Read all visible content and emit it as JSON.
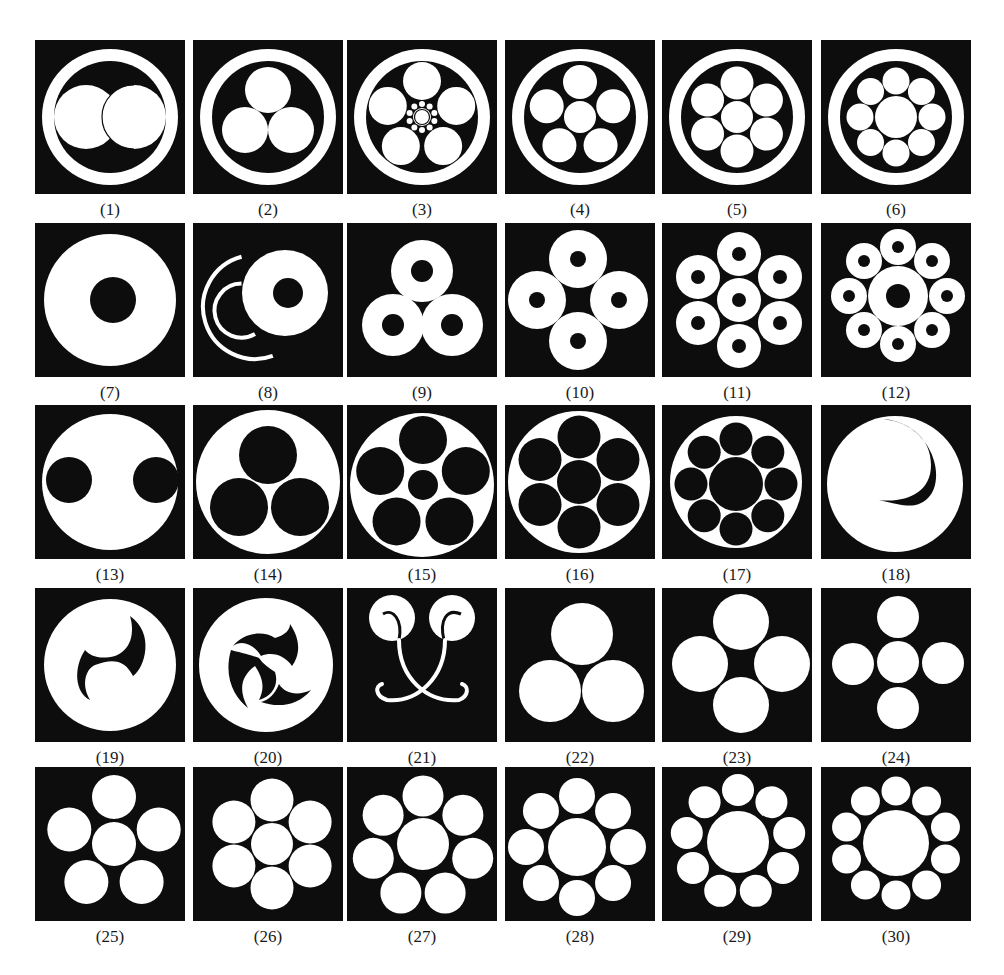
{
  "figure": {
    "title": "",
    "colors": {
      "background": "#ffffff",
      "tile": "#0d0d0d",
      "shape": "#ffffff",
      "label": "#1a1a1a"
    },
    "grid": {
      "columns_x": [
        35,
        193,
        347,
        505,
        662,
        821
      ],
      "rows_y": [
        40,
        223,
        405,
        588,
        767
      ],
      "tile_width": 150,
      "tile_height": 154,
      "label_offset": 160
    },
    "emblems": [
      {
        "id": 1,
        "label": "(1)",
        "name": "two-overlapping-circles-in-ring",
        "shapes": [
          [
            "ring",
            75,
            77,
            68,
            12
          ],
          [
            "c",
            51,
            77,
            32,
            "w"
          ],
          [
            "c",
            99,
            77,
            32,
            "w"
          ],
          [
            "arc",
            99,
            77,
            32,
            "k",
            1.2
          ]
        ]
      },
      {
        "id": 2,
        "label": "(2)",
        "name": "three-circles-in-ring",
        "shapes": [
          [
            "ring",
            75,
            77,
            68,
            12
          ],
          [
            "c",
            75,
            50,
            23,
            "w"
          ],
          [
            "c",
            52,
            90,
            23,
            "w"
          ],
          [
            "c",
            98,
            90,
            23,
            "w"
          ]
        ]
      },
      {
        "id": 3,
        "label": "(3)",
        "name": "five-circles-with-small-center-ring",
        "shapes": [
          [
            "ring",
            75,
            77,
            68,
            12
          ],
          [
            "poly5",
            75,
            77,
            36,
            19,
            "w"
          ],
          [
            "c",
            75,
            77,
            9,
            "w"
          ],
          [
            "c",
            75,
            77,
            7.5,
            "k-outline"
          ],
          [
            "dots",
            75,
            77,
            13,
            10,
            3,
            "w"
          ]
        ]
      },
      {
        "id": 4,
        "label": "(4)",
        "name": "six-circles-five-around-one-in-ring",
        "shapes": [
          [
            "ring",
            75,
            77,
            68,
            12
          ],
          [
            "c",
            75,
            77,
            16,
            "w"
          ],
          [
            "poly5",
            75,
            77,
            35,
            17,
            "w"
          ]
        ]
      },
      {
        "id": 5,
        "label": "(5)",
        "name": "seven-circles-in-ring",
        "shapes": [
          [
            "ring",
            75,
            77,
            68,
            12
          ],
          [
            "c",
            75,
            77,
            16,
            "w"
          ],
          [
            "poly6",
            75,
            77,
            34,
            16.5,
            "w"
          ]
        ]
      },
      {
        "id": 6,
        "label": "(6)",
        "name": "nine-circles-in-ring",
        "shapes": [
          [
            "ring",
            75,
            77,
            68,
            12
          ],
          [
            "c",
            75,
            77,
            21,
            "w"
          ],
          [
            "polyN",
            75,
            77,
            36,
            13.5,
            "w",
            8
          ]
        ]
      },
      {
        "id": 7,
        "label": "(7)",
        "name": "large-ring-disc",
        "shapes": [
          [
            "c",
            75,
            77,
            66,
            "w"
          ],
          [
            "c",
            78,
            77,
            23,
            "k"
          ]
        ]
      },
      {
        "id": 8,
        "label": "(8)",
        "name": "ring-disc-with-ripple-arcs",
        "shapes": [
          [
            "arcline",
            62,
            84,
            52,
            "w",
            4,
            105,
            290
          ],
          [
            "arcline",
            62,
            84,
            27,
            "w",
            4,
            120,
            270
          ],
          [
            "c",
            92,
            70,
            43,
            "w"
          ],
          [
            "c",
            95,
            70,
            15,
            "k"
          ]
        ]
      },
      {
        "id": 9,
        "label": "(9)",
        "name": "three-ring-discs",
        "shapes": [
          [
            "ringdisc",
            75,
            48,
            31,
            11
          ],
          [
            "ringdisc",
            46,
            102,
            31,
            11
          ],
          [
            "ringdisc",
            105,
            102,
            31,
            11
          ]
        ]
      },
      {
        "id": 10,
        "label": "(10)",
        "name": "four-ring-discs",
        "shapes": [
          [
            "ringdisc",
            73,
            36,
            29,
            8
          ],
          [
            "ringdisc",
            32,
            77,
            29,
            8
          ],
          [
            "ringdisc",
            114,
            77,
            29,
            8
          ],
          [
            "ringdisc",
            73,
            118,
            29,
            8
          ]
        ]
      },
      {
        "id": 11,
        "label": "(11)",
        "name": "seven-ring-discs",
        "shapes": [
          [
            "ringdisc",
            77,
            77,
            22,
            7
          ],
          [
            "ringdisc",
            77,
            31,
            22,
            7
          ],
          [
            "ringdisc",
            118,
            54,
            22,
            7
          ],
          [
            "ringdisc",
            118,
            100,
            22,
            7
          ],
          [
            "ringdisc",
            77,
            123,
            22,
            7
          ],
          [
            "ringdisc",
            36,
            100,
            22,
            7
          ],
          [
            "ringdisc",
            36,
            54,
            22,
            7
          ]
        ]
      },
      {
        "id": 12,
        "label": "(12)",
        "name": "nine-ring-discs",
        "shapes": [
          [
            "ringdisc",
            77,
            73,
            30,
            12
          ],
          [
            "ringdisc",
            77,
            24,
            18,
            6
          ],
          [
            "ringdisc",
            111,
            38,
            18,
            6
          ],
          [
            "ringdisc",
            126,
            73,
            18,
            6
          ],
          [
            "ringdisc",
            111,
            107,
            18,
            6
          ],
          [
            "ringdisc",
            77,
            121,
            18,
            6
          ],
          [
            "ringdisc",
            43,
            107,
            18,
            6
          ],
          [
            "ringdisc",
            28,
            73,
            18,
            6
          ],
          [
            "ringdisc",
            43,
            38,
            18,
            6
          ]
        ]
      },
      {
        "id": 13,
        "label": "(13)",
        "name": "disc-with-two-side-cutouts",
        "shapes": [
          [
            "c",
            75,
            77,
            68,
            "w"
          ],
          [
            "c",
            34,
            75,
            23,
            "k"
          ],
          [
            "c",
            121,
            75,
            23,
            "k"
          ]
        ]
      },
      {
        "id": 14,
        "label": "(14)",
        "name": "three-black-circles-in-disc",
        "shapes": [
          [
            "c",
            75,
            77,
            72,
            "w"
          ],
          [
            "c",
            75,
            50,
            29,
            "k"
          ],
          [
            "c",
            46,
            102,
            29,
            "k"
          ],
          [
            "c",
            107,
            102,
            29,
            "k"
          ]
        ]
      },
      {
        "id": 15,
        "label": "(15)",
        "name": "five-black-circles-with-center-in-disc",
        "shapes": [
          [
            "c",
            75,
            80,
            72,
            "w"
          ],
          [
            "c",
            76,
            80,
            15,
            "k"
          ],
          [
            "poly5",
            76,
            80,
            45,
            24,
            "k"
          ]
        ]
      },
      {
        "id": 16,
        "label": "(16)",
        "name": "seven-black-circles-in-disc",
        "shapes": [
          [
            "c",
            74,
            77,
            71,
            "w"
          ],
          [
            "c",
            74,
            77,
            22,
            "k"
          ],
          [
            "poly6",
            74,
            77,
            45,
            21.5,
            "k"
          ]
        ]
      },
      {
        "id": 17,
        "label": "(17)",
        "name": "nine-black-circles-in-disc",
        "shapes": [
          [
            "c",
            74,
            77,
            66,
            "w"
          ],
          [
            "c",
            74,
            79,
            27,
            "k"
          ],
          [
            "polyN",
            74,
            79,
            45,
            16.5,
            "k",
            8
          ]
        ]
      },
      {
        "id": 18,
        "label": "(18)",
        "name": "crescent-cut-disc",
        "shapes": [
          [
            "c",
            74,
            79,
            68,
            "w"
          ],
          [
            "crescent"
          ]
        ]
      },
      {
        "id": 19,
        "label": "(19)",
        "name": "two-comma-tomoe",
        "shapes": [
          [
            "c",
            75,
            77,
            66,
            "w"
          ],
          [
            "tomoe2"
          ]
        ]
      },
      {
        "id": 20,
        "label": "(20)",
        "name": "three-comma-tomoe",
        "shapes": [
          [
            "c",
            73,
            77,
            67,
            "w"
          ],
          [
            "tomoe3"
          ]
        ]
      },
      {
        "id": 21,
        "label": "(21)",
        "name": "two-circles-with-tendrils",
        "shapes": [
          [
            "c",
            45,
            30,
            23,
            "w"
          ],
          [
            "c",
            105,
            30,
            23,
            "w"
          ],
          [
            "tendrils"
          ]
        ]
      },
      {
        "id": 22,
        "label": "(22)",
        "name": "three-white-circles",
        "shapes": [
          [
            "c",
            77,
            46,
            31,
            "w"
          ],
          [
            "c",
            45,
            103,
            31,
            "w"
          ],
          [
            "c",
            108,
            103,
            31,
            "w"
          ]
        ]
      },
      {
        "id": 23,
        "label": "(23)",
        "name": "four-white-circles",
        "shapes": [
          [
            "c",
            79,
            34,
            28,
            "w"
          ],
          [
            "c",
            38,
            76,
            28,
            "w"
          ],
          [
            "c",
            120,
            76,
            28,
            "w"
          ],
          [
            "c",
            79,
            117,
            28,
            "w"
          ]
        ]
      },
      {
        "id": 24,
        "label": "(24)",
        "name": "five-white-circles-cross",
        "shapes": [
          [
            "c",
            77,
            74,
            21,
            "w"
          ],
          [
            "c",
            77,
            29,
            21,
            "w"
          ],
          [
            "c",
            77,
            120,
            21,
            "w"
          ],
          [
            "c",
            32,
            76,
            21,
            "w"
          ],
          [
            "c",
            122,
            75,
            21,
            "w"
          ]
        ]
      },
      {
        "id": 25,
        "label": "(25)",
        "name": "six-white-circles-five-around-one",
        "shapes": [
          [
            "c",
            79,
            77,
            22,
            "w"
          ],
          [
            "poly5",
            79,
            77,
            47,
            22,
            "w"
          ]
        ]
      },
      {
        "id": 26,
        "label": "(26)",
        "name": "seven-white-circles",
        "shapes": [
          [
            "c",
            79,
            77,
            21,
            "w"
          ],
          [
            "poly6",
            79,
            77,
            44,
            21.5,
            "w"
          ]
        ]
      },
      {
        "id": 27,
        "label": "(27)",
        "name": "eight-white-circles-seven-around-one",
        "shapes": [
          [
            "c",
            76,
            77,
            26,
            "w"
          ],
          [
            "polyN",
            76,
            80,
            51,
            20.5,
            "w",
            7
          ]
        ]
      },
      {
        "id": 28,
        "label": "(28)",
        "name": "nine-white-circles",
        "shapes": [
          [
            "c",
            72,
            80,
            29,
            "w"
          ],
          [
            "polyN",
            72,
            80,
            51,
            18,
            "w",
            8
          ]
        ]
      },
      {
        "id": 29,
        "label": "(29)",
        "name": "ten-white-circles",
        "shapes": [
          [
            "c",
            76,
            75,
            31,
            "w"
          ],
          [
            "polyN",
            76,
            75,
            52,
            16,
            "w",
            9
          ]
        ]
      },
      {
        "id": 30,
        "label": "(30)",
        "name": "eleven-white-circles",
        "shapes": [
          [
            "c",
            75,
            76,
            33,
            "w"
          ],
          [
            "polyN",
            75,
            76,
            52,
            14.5,
            "w",
            10
          ]
        ]
      }
    ]
  }
}
